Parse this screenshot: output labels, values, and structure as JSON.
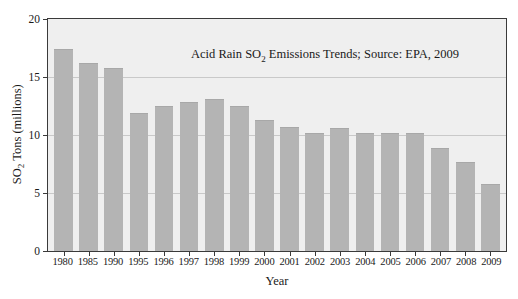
{
  "chart_data": {
    "type": "bar",
    "title": "Acid Rain SO2 Emissions Trends; Source: EPA, 2009",
    "title_parts": {
      "before": "Acid Rain SO",
      "sub": "2",
      "after": " Emissions Trends; Source: EPA, 2009"
    },
    "xlabel": "Year",
    "ylabel": "SO2 Tons (millions)",
    "ylabel_parts": {
      "before": "SO",
      "sub": "2",
      "after": " Tons (millions)"
    },
    "categories": [
      "1980",
      "1985",
      "1990",
      "1995",
      "1996",
      "1997",
      "1998",
      "1999",
      "2000",
      "2001",
      "2002",
      "2003",
      "2004",
      "2005",
      "2006",
      "2007",
      "2008",
      "2009"
    ],
    "values": [
      17.3,
      16.1,
      15.7,
      11.8,
      12.4,
      12.8,
      13.0,
      12.4,
      11.2,
      10.6,
      10.1,
      10.5,
      10.1,
      10.1,
      10.1,
      8.8,
      7.6,
      5.7
    ],
    "ylim": [
      0,
      20
    ],
    "yticks": [
      0,
      5,
      10,
      15,
      20
    ],
    "ytick_labels": [
      "0",
      "5",
      "10",
      "15",
      "20"
    ],
    "grid": true,
    "legend": "none",
    "series_name": "SO2 emissions",
    "bar_color": "#b4b4b4",
    "plot_background": "#efefef",
    "gridline_color": "#c9c9c9",
    "axis_color": "#3a3a3a"
  }
}
